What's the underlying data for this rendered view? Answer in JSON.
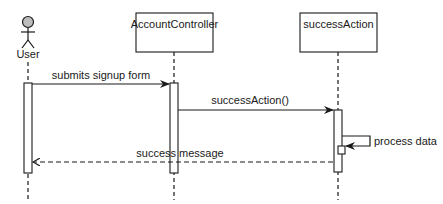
{
  "diagram": {
    "type": "sequence",
    "participants": [
      {
        "id": "user",
        "label": "User",
        "kind": "actor"
      },
      {
        "id": "controller",
        "label": "AccountController",
        "kind": "object"
      },
      {
        "id": "action",
        "label": "successAction",
        "kind": "object"
      }
    ],
    "messages": [
      {
        "from": "user",
        "to": "controller",
        "label": "submits signup form",
        "style": "solid"
      },
      {
        "from": "controller",
        "to": "action",
        "label": "successAction()",
        "style": "solid"
      },
      {
        "from": "action",
        "to": "action",
        "label": "process data",
        "style": "solid-self"
      },
      {
        "from": "action",
        "to": "user",
        "label": "success message",
        "style": "dashed-return"
      }
    ],
    "colors": {
      "line": "#1a1a1a",
      "actor_head": "#bdbdbd",
      "background": "#ffffff"
    }
  }
}
